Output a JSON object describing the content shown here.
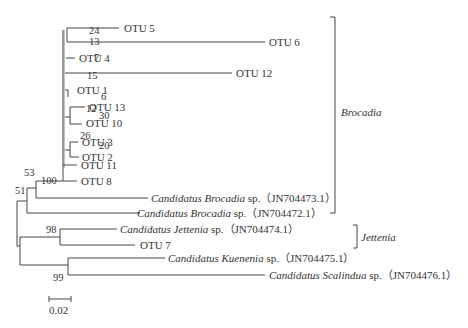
{
  "tree": {
    "taxa": {
      "otu5": "OTU 5",
      "otu6": "OTU 6",
      "otu4": "OTU 4",
      "otu12": "OTU 12",
      "otu1": "OTU 1",
      "otu13": "OTU 13",
      "otu10": "OTU 10",
      "otu3": "OTU 3",
      "otu2": "OTU 2",
      "otu11": "OTU 11",
      "otu8": "OTU 8",
      "brocadia473": {
        "genus": "Candidatus Brocadia",
        "rest": " sp.（JN704473.1）"
      },
      "brocadia472": {
        "genus": "Candidatus Brocadia",
        "rest": " sp.（JN704472.1）"
      },
      "jettenia474": {
        "genus": "Candidatus Jettenia",
        "rest": " sp.（JN704474.1）"
      },
      "otu7": "OTU 7",
      "kuenenia475": {
        "genus": "Candidatus Kuenenia",
        "rest": " sp.（JN704475.1）"
      },
      "scalindua476": {
        "genus": "Candidatus Scalindua",
        "rest": " sp.（JN704476.1）"
      }
    },
    "bootstrap": {
      "b24": "24",
      "b13": "13",
      "b7": "7",
      "b15": "15",
      "b6": "6",
      "b12": "12",
      "b30": "30",
      "b26": "26",
      "b20": "20",
      "b100": "100",
      "b53": "53",
      "b51": "51",
      "b98": "98",
      "b99": "99"
    },
    "clades": {
      "brocadia": "Brocadia",
      "jettenia": "Jettenia"
    },
    "scale_bar": "0.02"
  }
}
